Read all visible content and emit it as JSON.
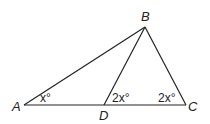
{
  "diagram": {
    "type": "triangle-geometry",
    "stroke_color": "#222222",
    "background": "#ffffff",
    "points": {
      "A": {
        "label": "A",
        "x": 24,
        "y": 105
      },
      "B": {
        "label": "B",
        "x": 145,
        "y": 27
      },
      "C": {
        "label": "C",
        "x": 186,
        "y": 105
      },
      "D": {
        "label": "D",
        "x": 104,
        "y": 105
      }
    },
    "segments": [
      "AB",
      "BC",
      "AC",
      "BD"
    ],
    "angle_labels": {
      "angle_A": "x°",
      "angle_BDC": "2x°",
      "angle_C": "2x°"
    }
  }
}
